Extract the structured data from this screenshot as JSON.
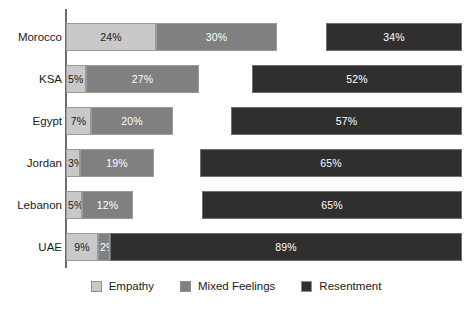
{
  "chart_data": {
    "type": "bar",
    "subtype": "horizontal-stacked",
    "title": "",
    "subtitle": "",
    "xlabel": "",
    "ylabel": "",
    "xlim": [
      0,
      100
    ],
    "grid": false,
    "legend_position": "bottom-center",
    "categories": [
      "Morocco",
      "KSA",
      "Egypt",
      "Jordan",
      "Lebanon",
      "UAE"
    ],
    "series": [
      {
        "name": "Empathy",
        "color": "#c9c9c9",
        "values": [
          24,
          5,
          7,
          3,
          5,
          9
        ],
        "labels": [
          "24%",
          "5%",
          "7%",
          "3%",
          "5%",
          "9%"
        ]
      },
      {
        "name": "Mixed Feelings",
        "color": "#808080",
        "values": [
          30,
          27,
          20,
          19,
          12,
          2
        ],
        "labels": [
          "30%",
          "27%",
          "20%",
          "19%",
          "12%",
          "2%"
        ]
      },
      {
        "name": "Resentment",
        "color": "#2f2f2f",
        "values": [
          34,
          52,
          57,
          65,
          65,
          89
        ],
        "labels": [
          "34%",
          "52%",
          "57%",
          "65%",
          "65%",
          "89%"
        ]
      }
    ]
  },
  "rows": [
    {
      "label": "Morocco",
      "empathy": {
        "label": "24%",
        "left": 0,
        "width": 90
      },
      "mixed": {
        "label": "30%",
        "left": 90,
        "width": 121
      },
      "resent": {
        "label": "34%",
        "left": 260,
        "width": 136
      }
    },
    {
      "label": "KSA",
      "empathy": {
        "label": "5%",
        "left": 0,
        "width": 20
      },
      "mixed": {
        "label": "27%",
        "left": 20,
        "width": 113
      },
      "resent": {
        "label": "52%",
        "left": 186,
        "width": 210
      }
    },
    {
      "label": "Egypt",
      "empathy": {
        "label": "7%",
        "left": 0,
        "width": 25
      },
      "mixed": {
        "label": "20%",
        "left": 25,
        "width": 82
      },
      "resent": {
        "label": "57%",
        "left": 165,
        "width": 231
      }
    },
    {
      "label": "Jordan",
      "empathy": {
        "label": "3%",
        "left": 0,
        "width": 14
      },
      "mixed": {
        "label": "19%",
        "left": 14,
        "width": 74
      },
      "resent": {
        "label": "65%",
        "left": 134,
        "width": 262
      }
    },
    {
      "label": "Lebanon",
      "empathy": {
        "label": "5%",
        "left": 0,
        "width": 16
      },
      "mixed": {
        "label": "12%",
        "left": 16,
        "width": 51
      },
      "resent": {
        "label": "65%",
        "left": 136,
        "width": 260
      }
    },
    {
      "label": "UAE",
      "empathy": {
        "label": "9%",
        "left": 0,
        "width": 32
      },
      "mixed": {
        "label": "2%",
        "left": 32,
        "width": 12
      },
      "resent": {
        "label": "89%",
        "left": 44,
        "width": 352
      }
    }
  ],
  "row_tops": [
    16,
    58,
    100,
    142,
    184,
    226
  ],
  "legend": {
    "items": [
      {
        "label": "Empathy",
        "color": "#c9c9c9"
      },
      {
        "label": "Mixed Feelings",
        "color": "#808080"
      },
      {
        "label": "Resentment",
        "color": "#2f2f2f"
      }
    ]
  },
  "colors": {
    "empathy": "#c9c9c9",
    "mixed_feelings": "#808080",
    "resentment": "#2f2f2f",
    "axis": "#6e6e6e",
    "background": "#ffffff",
    "text": "#1a1a1a"
  }
}
